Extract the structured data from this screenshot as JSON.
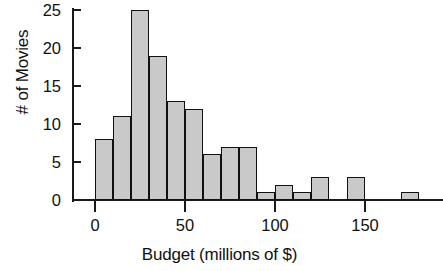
{
  "chart_data": {
    "type": "bar",
    "title": "",
    "xlabel": "Budget (millions of $)",
    "ylabel": "# of Movies",
    "bin_width": 10,
    "bin_starts": [
      0,
      10,
      20,
      30,
      40,
      50,
      60,
      70,
      80,
      90,
      100,
      110,
      120,
      130,
      140,
      150,
      160,
      170
    ],
    "categories": [
      "0-10",
      "10-20",
      "20-30",
      "30-40",
      "40-50",
      "50-60",
      "60-70",
      "70-80",
      "80-90",
      "90-100",
      "100-110",
      "110-120",
      "120-130",
      "130-140",
      "140-150",
      "150-160",
      "160-170",
      "170-180"
    ],
    "values": [
      8,
      11,
      25,
      19,
      13,
      12,
      6,
      7,
      7,
      1,
      2,
      1,
      3,
      0,
      3,
      0,
      0,
      1
    ],
    "xlim": [
      0,
      180
    ],
    "ylim": [
      0,
      25
    ],
    "x_ticks": [
      0,
      50,
      100,
      150
    ],
    "x_tick_labels": [
      "0",
      "50",
      "100",
      "150"
    ],
    "y_ticks": [
      0,
      5,
      10,
      15,
      20,
      25
    ],
    "y_tick_labels": [
      "0",
      "5",
      "10",
      "15",
      "20",
      "25"
    ],
    "grid": false,
    "legend": false,
    "bar_fill_color": "#c9c9c9",
    "bar_edge_color": "#111111",
    "axis_color": "#1a1a1a"
  }
}
